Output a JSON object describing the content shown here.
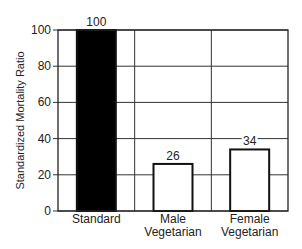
{
  "chart_data": {
    "type": "bar",
    "title": "",
    "xlabel": "",
    "ylabel": "Standardized Mortality Ratio",
    "categories": [
      "Standard",
      "Male\nVegetarian",
      "Female\nVegetarian"
    ],
    "category_lines": [
      [
        "Standard"
      ],
      [
        "Male",
        "Vegetarian"
      ],
      [
        "Female",
        "Vegetarian"
      ]
    ],
    "values": [
      100,
      26,
      34
    ],
    "value_labels": [
      "100",
      "26",
      "34"
    ],
    "bar_fills": [
      "#000000",
      "#ffffff",
      "#ffffff"
    ],
    "ylim": [
      0,
      100
    ],
    "yticks": [
      0,
      20,
      40,
      60,
      80,
      100
    ],
    "grid": true,
    "legend": null
  }
}
